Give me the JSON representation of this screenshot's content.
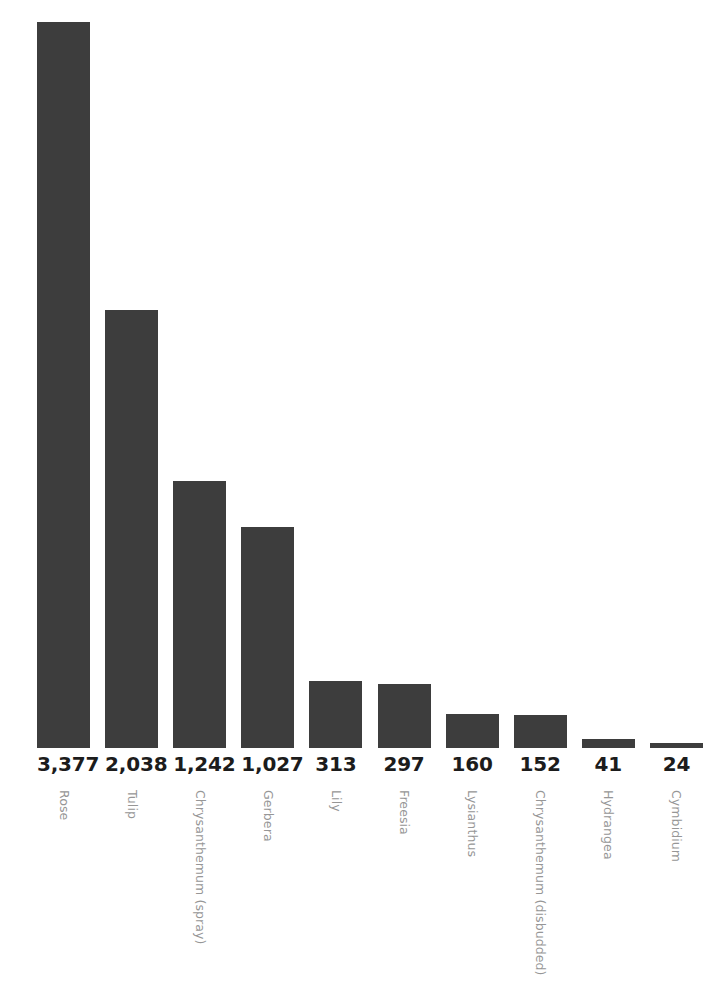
{
  "chart_data": {
    "type": "bar",
    "title": "",
    "subtitle": "",
    "xlabel": "",
    "ylabel": "",
    "grid": false,
    "legend": false,
    "orientation": "vertical",
    "ylim": [
      0,
      3377
    ],
    "bar_color": "#3d3d3d",
    "value_label_color": "#1c1c1c",
    "category_label_color": "#969696",
    "background_color": "#ffffff",
    "category_label_rotation": 90,
    "categories": [
      "Rose",
      "Tulip",
      "Chrysanthemum (spray)",
      "Gerbera",
      "Lily",
      "Freesia",
      "Lysianthus",
      "Chrysanthemum (disbudded)",
      "Hydrangea",
      "Cymbidium"
    ],
    "values": [
      3377,
      2038,
      1242,
      1027,
      313,
      297,
      160,
      152,
      41,
      24
    ],
    "value_labels": [
      "3,377",
      "2,038",
      "1,242",
      "1,027",
      "313",
      "297",
      "160",
      "152",
      "41",
      "24"
    ]
  },
  "bars": [
    {
      "category": "Rose",
      "value": 3377,
      "value_label": "3,377"
    },
    {
      "category": "Tulip",
      "value": 2038,
      "value_label": "2,038"
    },
    {
      "category": "Chrysanthemum (spray)",
      "value": 1242,
      "value_label": "1,242"
    },
    {
      "category": "Gerbera",
      "value": 1027,
      "value_label": "1,027"
    },
    {
      "category": "Lily",
      "value": 313,
      "value_label": "313"
    },
    {
      "category": "Freesia",
      "value": 297,
      "value_label": "297"
    },
    {
      "category": "Lysianthus",
      "value": 160,
      "value_label": "160"
    },
    {
      "category": "Chrysanthemum (disbudded)",
      "value": 152,
      "value_label": "152"
    },
    {
      "category": "Hydrangea",
      "value": 41,
      "value_label": "41"
    },
    {
      "category": "Cymbidium",
      "value": 24,
      "value_label": "24"
    }
  ]
}
